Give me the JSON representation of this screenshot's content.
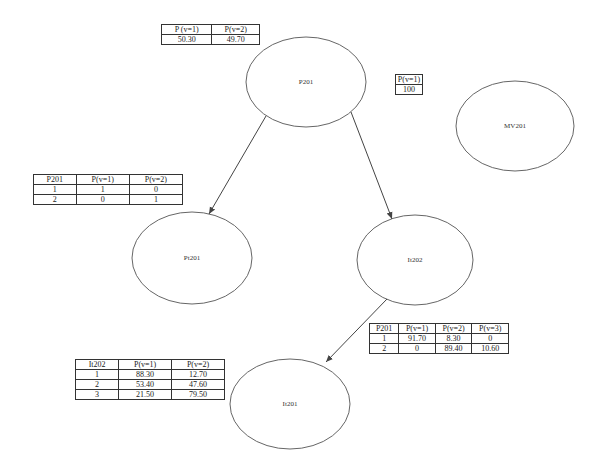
{
  "nodes": [
    {
      "id": "P201",
      "label": "P201"
    },
    {
      "id": "MV201",
      "label": "MV201"
    },
    {
      "id": "Pt201",
      "label": "Pt201"
    },
    {
      "id": "It202",
      "label": "It202"
    },
    {
      "id": "It201",
      "label": "It201"
    }
  ],
  "edges": [
    {
      "from": "P201",
      "to": "Pt201"
    },
    {
      "from": "P201",
      "to": "It202"
    },
    {
      "from": "It202",
      "to": "It201"
    }
  ],
  "tables": {
    "p201_prior": {
      "headers": [
        "P (v=1)",
        "P(v=2)"
      ],
      "rows": [
        [
          "50.30",
          "49.70"
        ]
      ]
    },
    "mv201_prior": {
      "headers": [
        "P(v=1)"
      ],
      "rows": [
        [
          "100"
        ]
      ]
    },
    "pt201_cpt": {
      "headers": [
        "P201",
        "P(v=1)",
        "P(v=2)"
      ],
      "rows": [
        [
          "1",
          "1",
          "0"
        ],
        [
          "2",
          "0",
          "1"
        ]
      ]
    },
    "it202_cpt": {
      "headers": [
        "P201",
        "P(v=1)",
        "P(v=2)",
        "P(v=3)"
      ],
      "rows": [
        [
          "1",
          "91.70",
          "8.30",
          "0"
        ],
        [
          "2",
          "0",
          "89.40",
          "10.60"
        ]
      ]
    },
    "it201_cpt": {
      "headers": [
        "It202",
        "P(v=1)",
        "P(v=2)"
      ],
      "rows": [
        [
          "1",
          "88.30",
          "12.70"
        ],
        [
          "2",
          "53.40",
          "47.60"
        ],
        [
          "3",
          "21.50",
          "79.50"
        ]
      ]
    }
  },
  "colors": {
    "stroke": "#555555",
    "background": "#ffffff"
  }
}
